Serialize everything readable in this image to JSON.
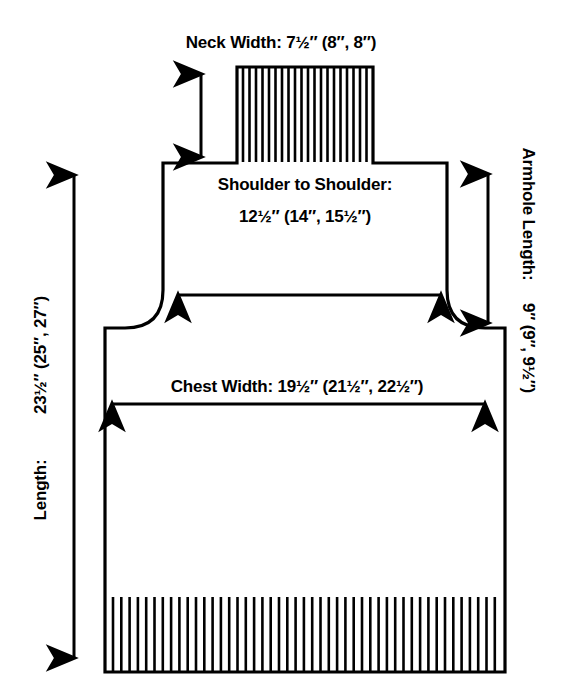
{
  "diagram": {
    "type": "sweater-front-schematic",
    "units": "inches",
    "size_notation": "small (medium, large)",
    "measurements": {
      "neck_width": {
        "label": "Neck Width:",
        "value": "7½″ (8″, 8″)",
        "full": "Neck Width:   7½″ (8″, 8″)",
        "sizes": [
          "7½″",
          "8″",
          "8″"
        ]
      },
      "shoulder_to_shoulder": {
        "label": "Shoulder to Shoulder:",
        "value": "12½″ (14″, 15½″)",
        "sizes": [
          "12½″",
          "14″",
          "15½″"
        ]
      },
      "chest_width": {
        "label": "Chest Width:",
        "value": "19½″ (21½″, 22½″)",
        "full": "Chest Width:   19½″ (21½″, 22½″)",
        "sizes": [
          "19½″",
          "21½″",
          "22½″"
        ]
      },
      "length": {
        "label": "Length:",
        "value": "23½″ (25″, 27″)",
        "sizes": [
          "23½″",
          "25″",
          "27″"
        ]
      },
      "armhole_length": {
        "label": "Armhole Length:",
        "value": "9″ (9″, 9½″)",
        "sizes": [
          "9″",
          "9″",
          "9½″"
        ]
      }
    },
    "arrows": {
      "neck_depth": "double-headed-vertical-arrow",
      "shoulder_span": "double-headed-horizontal-arrow",
      "chest_span": "double-headed-horizontal-arrow",
      "length_span": "double-headed-vertical-arrow",
      "armhole_span": "double-headed-vertical-arrow"
    },
    "ribbing": {
      "neck_stripe_count": 23,
      "hem_stripe_count": 47
    },
    "colors": {
      "stroke": "#000000",
      "background": "#ffffff"
    }
  }
}
